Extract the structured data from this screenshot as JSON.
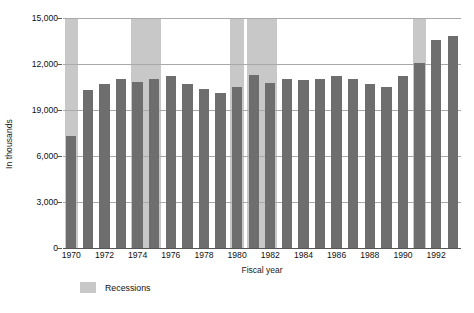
{
  "chart_data": {
    "type": "bar",
    "title": "",
    "xlabel": "Fiscal year",
    "ylabel": "In thousands",
    "ylim": [
      0,
      15000
    ],
    "ytick_values": [
      0,
      3000,
      6000,
      9000,
      12000,
      15000
    ],
    "ytick_labels": [
      "0",
      "3,000",
      "6,000",
      "19,000",
      "12,000",
      "15,000"
    ],
    "grid": true,
    "legend_position": "bottom-left",
    "legend": [
      {
        "label": "Recessions",
        "color": "#c8c8c8"
      }
    ],
    "bar_color": "#6e6e6e",
    "categories": [
      "1970",
      "1971",
      "1972",
      "1973",
      "1974",
      "1975",
      "1976",
      "1977",
      "1978",
      "1979",
      "1980",
      "1981",
      "1982",
      "1983",
      "1984",
      "1985",
      "1986",
      "1987",
      "1988",
      "1989",
      "1990",
      "1991",
      "1992",
      "1993"
    ],
    "xtick_labels": [
      "1970",
      "1972",
      "1974",
      "1976",
      "1978",
      "1980",
      "1982",
      "1984",
      "1986",
      "1988",
      "1990",
      "1992"
    ],
    "values": [
      7300,
      10300,
      10700,
      11000,
      10800,
      11000,
      11200,
      10700,
      10400,
      10100,
      10500,
      11300,
      10750,
      11000,
      10950,
      11000,
      11200,
      11000,
      10700,
      10500,
      11200,
      12050,
      13550,
      13800
    ],
    "annotations": [
      {
        "name": "recession-1970",
        "start": "1970",
        "end": "1970",
        "label": "Recession 1970"
      },
      {
        "name": "recession-1974",
        "start": "1974",
        "end": "1975",
        "label": "Recession 1974-75"
      },
      {
        "name": "recession-1980",
        "start": "1980",
        "end": "1980",
        "label": "Recession 1980"
      },
      {
        "name": "recession-1982",
        "start": "1981",
        "end": "1982",
        "label": "Recession 1981-82"
      },
      {
        "name": "recession-1991",
        "start": "1991",
        "end": "1991",
        "label": "Recession 1990-91"
      }
    ]
  },
  "legend": {
    "recessions_label": "Recessions"
  },
  "axes": {
    "y_title": "In thousands",
    "x_title": "Fiscal year"
  }
}
